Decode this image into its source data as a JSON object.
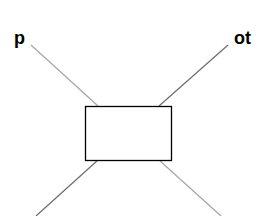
{
  "diagram": {
    "type": "vertex-box-diagram",
    "labels": {
      "top_left": "p",
      "top_right": "ot"
    },
    "box": {
      "x": 85,
      "y": 106,
      "width": 87,
      "height": 54,
      "stroke": "#000000"
    },
    "legs": [
      {
        "name": "top-left-leg",
        "x1": 31,
        "y1": 45,
        "x2": 98,
        "y2": 106,
        "color": "#a8a8a8"
      },
      {
        "name": "top-right-leg",
        "x1": 228,
        "y1": 45,
        "x2": 159,
        "y2": 106,
        "color": "#707070"
      },
      {
        "name": "bottom-left-leg",
        "x1": 36,
        "y1": 216,
        "x2": 98,
        "y2": 160,
        "color": "#707070"
      },
      {
        "name": "bottom-right-leg",
        "x1": 221,
        "y1": 216,
        "x2": 159,
        "y2": 160,
        "color": "#a8a8a8"
      }
    ]
  }
}
